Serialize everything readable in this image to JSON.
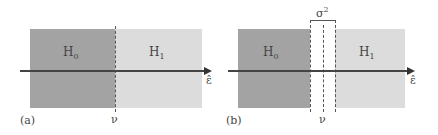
{
  "panels": [
    {
      "label": "(a)",
      "left_region": {
        "text": "H",
        "sub": "0",
        "color": "#a3a3a3"
      },
      "right_region": {
        "text": "H",
        "sub": "1",
        "color": "#dcdcdc"
      },
      "threshold_label": "ν",
      "axis_label": "ε̂"
    },
    {
      "label": "(b)",
      "left_region": {
        "text": "H",
        "sub": "0",
        "color": "#a3a3a3"
      },
      "right_region": {
        "text": "H",
        "sub": "1",
        "color": "#dcdcdc"
      },
      "threshold_label": "ν",
      "axis_label": "ε̂",
      "gap_label": "σ",
      "gap_label_sup": "2"
    }
  ]
}
